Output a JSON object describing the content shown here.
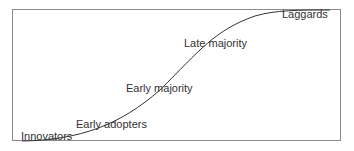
{
  "diagram": {
    "type": "adoption-s-curve",
    "labels": [
      {
        "text": "Innovators",
        "x": 21,
        "y": 131
      },
      {
        "text": "Early adopters",
        "x": 76,
        "y": 119
      },
      {
        "text": "Early majority",
        "x": 126,
        "y": 83
      },
      {
        "text": "Late majority",
        "x": 184,
        "y": 38
      },
      {
        "text": "Laggards",
        "x": 282,
        "y": 9
      }
    ],
    "colors": {
      "line": "#333333",
      "frame": "#8a8a8a",
      "text": "#333333"
    }
  }
}
